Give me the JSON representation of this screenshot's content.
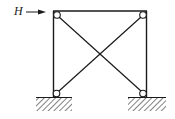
{
  "diagram": {
    "type": "braced frame with pinned supports",
    "load": {
      "label": "H",
      "direction": "right",
      "applied_at": "top-left joint"
    },
    "members": [
      {
        "name": "top-beam",
        "from": "top-left",
        "to": "top-right"
      },
      {
        "name": "left-column",
        "from": "top-left",
        "to": "bottom-left"
      },
      {
        "name": "right-column",
        "from": "top-right",
        "to": "bottom-right"
      },
      {
        "name": "diagonal-brace-1",
        "from": "top-left",
        "to": "bottom-right"
      },
      {
        "name": "diagonal-brace-2",
        "from": "top-right",
        "to": "bottom-left"
      }
    ],
    "joints": [
      {
        "name": "top-left",
        "type": "hinge"
      },
      {
        "name": "top-right",
        "type": "hinge"
      },
      {
        "name": "bottom-left",
        "type": "pinned-support"
      },
      {
        "name": "bottom-right",
        "type": "pinned-support"
      }
    ],
    "colors": {
      "stroke": "#1a1a1a",
      "background": "#ffffff"
    }
  }
}
